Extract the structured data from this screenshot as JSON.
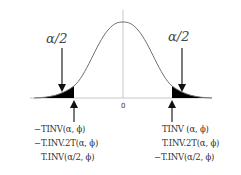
{
  "diagram": {
    "type": "normal-distribution-two-tailed",
    "center_label": "0",
    "left_tail": {
      "area_label": "α/2",
      "formulas": [
        "−TINV(α, ϕ)",
        "−T.INV.2T(α, ϕ)",
        "T.INV(α/2, ϕ)"
      ]
    },
    "right_tail": {
      "area_label": "α/2",
      "formulas": [
        "TINV (α, ϕ)",
        "T.INV.2T(α, ϕ)",
        "−T.INV(α/2, ϕ)"
      ]
    },
    "colors": {
      "curve": "#666666",
      "shade": "#000000",
      "axis": "#bbbbbb",
      "arrow": "#222222"
    }
  }
}
